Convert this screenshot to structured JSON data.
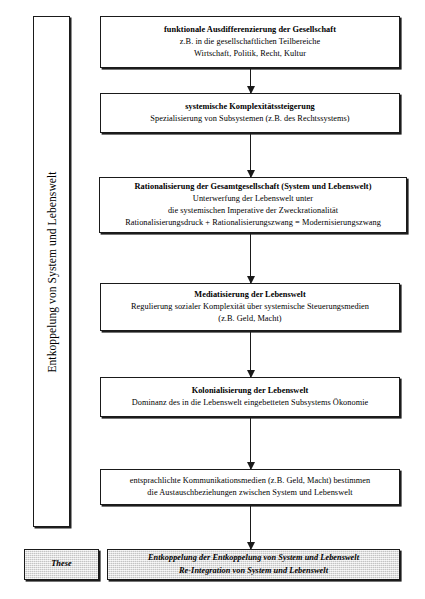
{
  "diagram": {
    "side_bracket": {
      "label": "Entkoppelung von System und Lebenswelt"
    },
    "thesis_tag": {
      "label": "These"
    },
    "nodes": [
      {
        "id": "funktionale-ausdifferenzierung",
        "heading": "funktionale Ausdifferenzierung der Gesellschaft",
        "lines": [
          "z.B. in die gesellschaftlichen Teilbereiche",
          "Wirtschaft, Politik, Recht, Kultur"
        ]
      },
      {
        "id": "systemische-komplexitaetssteigerung",
        "heading": "systemische Komplexitätssteigerung",
        "lines": [
          "Spezialisierung von Subsystemen (z.B. des Rechtssystems)"
        ]
      },
      {
        "id": "rationalisierung-gesamtgesellschaft",
        "heading": "Rationalisierung der Gesamtgesellschaft (System und Lebenswelt)",
        "lines": [
          "Unterwerfung der Lebenswelt unter",
          "die systemischen Imperative der Zweckrationalität",
          "Rationalisierungsdruck + Rationalisierungszwang = Modernisierungszwang"
        ]
      },
      {
        "id": "mediatisierung-lebenswelt",
        "heading": "Mediatisierung der Lebenswelt",
        "lines": [
          "Regulierung sozialer Komplexität über systemische Steuerungsmedien",
          "(z.B. Geld, Macht)"
        ]
      },
      {
        "id": "kolonialisierung-lebenswelt",
        "heading": "Kolonialisierung der Lebenswelt",
        "lines": [
          "Dominanz des in die Lebenswelt eingebetteten Subsystems Ökonomie"
        ]
      },
      {
        "id": "entsprachlichte-kommunikationsmedien",
        "heading": "",
        "lines": [
          "entsprachlichte Kommunikationsmedien (z.B. Geld, Macht) bestimmen",
          "die Austauschbeziehungen zwischen System und Lebenswelt"
        ]
      },
      {
        "id": "entkoppelung-der-entkoppelung",
        "heading": "",
        "lines": [
          "Entkoppelung der Entkoppelung von System und Lebenswelt",
          "Re-Integration von System und Lebenswelt"
        ]
      }
    ],
    "colors": {
      "line": "#1a1a1a",
      "background": "#ffffff",
      "shaded_fill": "#d8d8d8"
    }
  }
}
